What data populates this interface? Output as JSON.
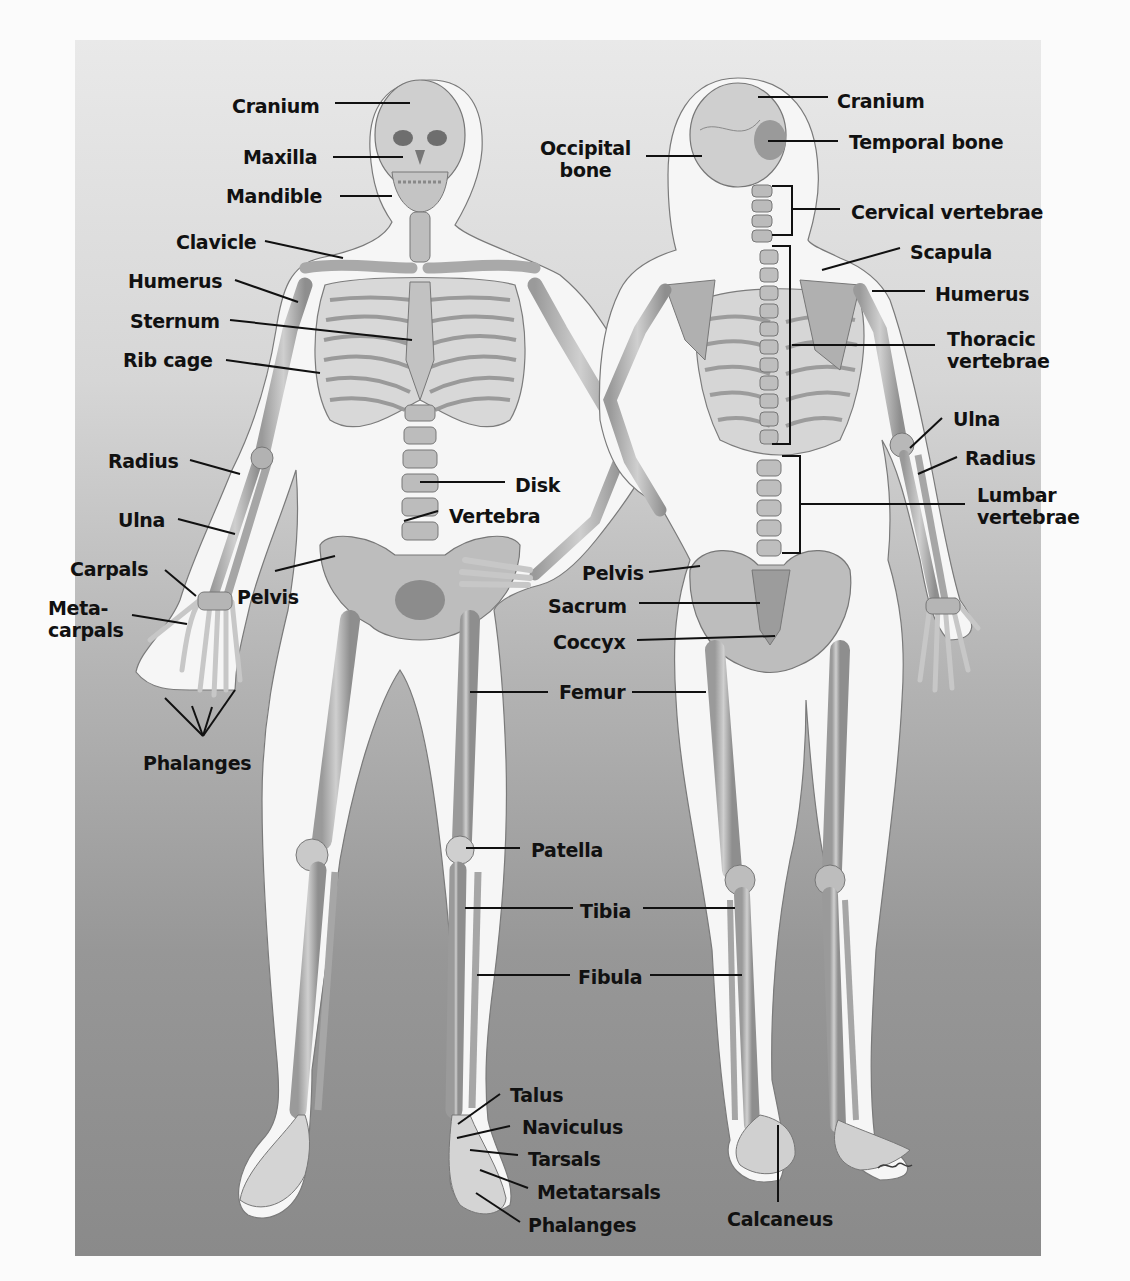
{
  "figure": {
    "colors": {
      "page_bg": "#fbfbfb",
      "panel_top": "#e9e9e9",
      "panel_bottom": "#8a8a8a",
      "body_outline": "#f7f7f7",
      "bone": "#bdbdbd",
      "bone_dark": "#8f8f8f",
      "label_text": "#111111",
      "leader_line": "#111111"
    },
    "signature": "artist-signature"
  },
  "anterior_view": {
    "labels": [
      {
        "id": "cranium",
        "text": "Cranium",
        "x": 232,
        "y": 95,
        "line": [
          [
            335,
            103
          ],
          [
            410,
            103
          ]
        ]
      },
      {
        "id": "maxilla",
        "text": "Maxilla",
        "x": 243,
        "y": 146,
        "line": [
          [
            333,
            157
          ],
          [
            403,
            157
          ]
        ]
      },
      {
        "id": "mandible",
        "text": "Mandible",
        "x": 226,
        "y": 185,
        "line": [
          [
            340,
            196
          ],
          [
            392,
            196
          ]
        ]
      },
      {
        "id": "clavicle",
        "text": "Clavicle",
        "x": 176,
        "y": 231,
        "line": [
          [
            265,
            241
          ],
          [
            343,
            258
          ]
        ]
      },
      {
        "id": "humerus",
        "text": "Humerus",
        "x": 128,
        "y": 270,
        "line": [
          [
            235,
            280
          ],
          [
            298,
            302
          ]
        ]
      },
      {
        "id": "sternum",
        "text": "Sternum",
        "x": 130,
        "y": 310,
        "line": [
          [
            230,
            320
          ],
          [
            412,
            340
          ]
        ]
      },
      {
        "id": "rib-cage",
        "text": "Rib cage",
        "x": 123,
        "y": 349,
        "line": [
          [
            226,
            360
          ],
          [
            320,
            373
          ]
        ]
      },
      {
        "id": "radius",
        "text": "Radius",
        "x": 108,
        "y": 450,
        "line": [
          [
            190,
            460
          ],
          [
            240,
            474
          ]
        ]
      },
      {
        "id": "ulna",
        "text": "Ulna",
        "x": 118,
        "y": 509,
        "line": [
          [
            178,
            519
          ],
          [
            235,
            534
          ]
        ]
      },
      {
        "id": "carpals",
        "text": "Carpals",
        "x": 70,
        "y": 558,
        "line": [
          [
            165,
            570
          ],
          [
            196,
            596
          ]
        ]
      },
      {
        "id": "metacarpals",
        "text": "Meta-\ncarpals",
        "x": 48,
        "y": 597,
        "line": [
          [
            132,
            615
          ],
          [
            187,
            624
          ]
        ]
      },
      {
        "id": "pelvis",
        "text": "Pelvis",
        "x": 237,
        "y": 586,
        "line": [
          [
            275,
            571
          ],
          [
            335,
            556
          ]
        ]
      },
      {
        "id": "phalanges-hand",
        "text": "Phalanges",
        "x": 143,
        "y": 752,
        "fan": [
          [
            203,
            736
          ],
          [
            165,
            698
          ],
          [
            192,
            706
          ],
          [
            212,
            707
          ],
          [
            235,
            690
          ]
        ]
      },
      {
        "id": "disk",
        "text": "Disk",
        "x": 515,
        "y": 474,
        "line": [
          [
            420,
            482
          ],
          [
            505,
            482
          ]
        ]
      },
      {
        "id": "vertebra",
        "text": "Vertebra",
        "x": 449,
        "y": 505,
        "line": [
          [
            404,
            521
          ],
          [
            438,
            511
          ]
        ]
      },
      {
        "id": "femur",
        "text": "Femur",
        "x": 559,
        "y": 681,
        "line": [
          [
            470,
            692
          ],
          [
            548,
            692
          ]
        ]
      },
      {
        "id": "patella",
        "text": "Patella",
        "x": 531,
        "y": 839,
        "line": [
          [
            466,
            848
          ],
          [
            520,
            848
          ]
        ]
      },
      {
        "id": "tibia",
        "text": "Tibia",
        "x": 580,
        "y": 900,
        "line": [
          [
            465,
            908
          ],
          [
            573,
            908
          ]
        ]
      },
      {
        "id": "fibula",
        "text": "Fibula",
        "x": 578,
        "y": 966,
        "line": [
          [
            477,
            975
          ],
          [
            570,
            975
          ]
        ]
      },
      {
        "id": "talus",
        "text": "Talus",
        "x": 510,
        "y": 1084,
        "line": [
          [
            500,
            1094
          ],
          [
            458,
            1124
          ]
        ]
      },
      {
        "id": "naviculus",
        "text": "Naviculus",
        "x": 522,
        "y": 1116,
        "line": [
          [
            510,
            1126
          ],
          [
            457,
            1138
          ]
        ]
      },
      {
        "id": "tarsals",
        "text": "Tarsals",
        "x": 528,
        "y": 1148,
        "line": [
          [
            518,
            1155
          ],
          [
            470,
            1150
          ]
        ]
      },
      {
        "id": "metatarsals",
        "text": "Metatarsals",
        "x": 537,
        "y": 1181,
        "line": [
          [
            528,
            1188
          ],
          [
            480,
            1170
          ]
        ]
      },
      {
        "id": "phalanges-foot",
        "text": "Phalanges",
        "x": 528,
        "y": 1214,
        "line": [
          [
            520,
            1222
          ],
          [
            476,
            1193
          ]
        ]
      }
    ]
  },
  "posterior_view": {
    "labels": [
      {
        "id": "cranium-posterior",
        "text": "Cranium",
        "x": 837,
        "y": 90,
        "line": [
          [
            758,
            97
          ],
          [
            828,
            97
          ]
        ]
      },
      {
        "id": "temporal-bone",
        "text": "Temporal bone",
        "x": 849,
        "y": 131,
        "line": [
          [
            768,
            141
          ],
          [
            838,
            141
          ]
        ]
      },
      {
        "id": "occipital-bone",
        "text": "Occipital\nbone",
        "x": 540,
        "y": 137,
        "line": [
          [
            646,
            156
          ],
          [
            702,
            156
          ]
        ],
        "align": "c"
      },
      {
        "id": "cervical-vertebrae",
        "text": "Cervical vertebrae",
        "x": 851,
        "y": 201,
        "line": [
          [
            792,
            209
          ],
          [
            840,
            209
          ]
        ],
        "bracket": [
          [
            772,
            186
          ],
          [
            792,
            186
          ],
          [
            792,
            235
          ],
          [
            772,
            235
          ]
        ]
      },
      {
        "id": "scapula",
        "text": "Scapula",
        "x": 910,
        "y": 241,
        "line": [
          [
            900,
            248
          ],
          [
            822,
            270
          ]
        ]
      },
      {
        "id": "humerus-posterior",
        "text": "Humerus",
        "x": 935,
        "y": 283,
        "line": [
          [
            872,
            291
          ],
          [
            925,
            291
          ]
        ]
      },
      {
        "id": "thoracic-vertebrae",
        "text": "Thoracic\nvertebrae",
        "x": 947,
        "y": 328,
        "line": [
          [
            792,
            345
          ],
          [
            935,
            345
          ]
        ],
        "bracket": [
          [
            772,
            246
          ],
          [
            790,
            246
          ],
          [
            790,
            444
          ],
          [
            772,
            444
          ]
        ]
      },
      {
        "id": "ulna-posterior",
        "text": "Ulna",
        "x": 953,
        "y": 408,
        "line": [
          [
            942,
            418
          ],
          [
            910,
            448
          ]
        ]
      },
      {
        "id": "radius-posterior",
        "text": "Radius",
        "x": 965,
        "y": 447,
        "line": [
          [
            957,
            457
          ],
          [
            918,
            474
          ]
        ]
      },
      {
        "id": "lumbar-vertebrae",
        "text": "Lumbar\nvertebrae",
        "x": 977,
        "y": 484,
        "line": [
          [
            800,
            504
          ],
          [
            965,
            504
          ]
        ],
        "bracket": [
          [
            782,
            456
          ],
          [
            800,
            456
          ],
          [
            800,
            553
          ],
          [
            782,
            553
          ]
        ]
      },
      {
        "id": "pelvis-posterior",
        "text": "Pelvis",
        "x": 582,
        "y": 562,
        "line": [
          [
            649,
            572
          ],
          [
            700,
            566
          ]
        ]
      },
      {
        "id": "sacrum",
        "text": "Sacrum",
        "x": 548,
        "y": 595,
        "line": [
          [
            639,
            603
          ],
          [
            760,
            603
          ]
        ]
      },
      {
        "id": "coccyx",
        "text": "Coccyx",
        "x": 553,
        "y": 631,
        "line": [
          [
            637,
            640
          ],
          [
            775,
            636
          ]
        ]
      },
      {
        "id": "femur-posterior",
        "text": "Femur-line-right",
        "x": 0,
        "y": 0,
        "line": [
          [
            632,
            692
          ],
          [
            706,
            692
          ]
        ],
        "hidden": true
      },
      {
        "id": "tibia-posterior",
        "text": "tibia-line-right",
        "x": 0,
        "y": 0,
        "line": [
          [
            643,
            908
          ],
          [
            735,
            908
          ]
        ],
        "hidden": true
      },
      {
        "id": "fibula-posterior",
        "text": "fibula-line-right",
        "x": 0,
        "y": 0,
        "line": [
          [
            650,
            975
          ],
          [
            742,
            975
          ]
        ],
        "hidden": true
      },
      {
        "id": "calcaneus",
        "text": "Calcaneus",
        "x": 727,
        "y": 1208,
        "line": [
          [
            778,
            1125
          ],
          [
            778,
            1202
          ]
        ]
      }
    ]
  }
}
